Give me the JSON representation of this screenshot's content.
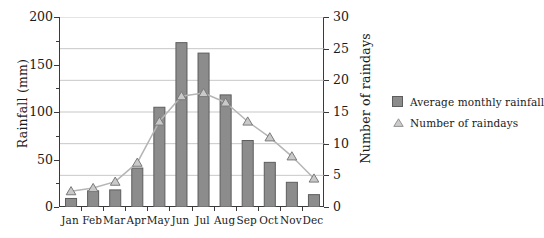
{
  "chart_data": {
    "type": "bar",
    "title": "",
    "categories": [
      "Jan",
      "Feb",
      "Mar",
      "Apr",
      "May",
      "Jun",
      "Jul",
      "Aug",
      "Sep",
      "Oct",
      "Nov",
      "Dec"
    ],
    "series": [
      {
        "name": "Average monthly rainfall",
        "type": "bar",
        "axis": "left",
        "unit": "mm",
        "values": [
          9,
          17,
          18,
          41,
          105,
          173,
          162,
          118,
          70,
          47,
          26,
          13
        ]
      },
      {
        "name": "Number of raindays",
        "type": "line-marker",
        "axis": "right",
        "unit": "days",
        "values": [
          2.5,
          3,
          4,
          7,
          13.5,
          17.5,
          18,
          16.5,
          13.5,
          11,
          8,
          4.5
        ]
      }
    ],
    "xlabel": "",
    "ylabel": "Rainfall (mm)",
    "y2label": "Number of raindays",
    "ylim": [
      0,
      200
    ],
    "y2lim": [
      0,
      30
    ],
    "yticks": [
      0,
      50,
      100,
      150,
      200
    ],
    "y2ticks": [
      0,
      5,
      10,
      15,
      20,
      25,
      30
    ],
    "ytick_labels": [
      "0",
      "50",
      "100",
      "150",
      "200"
    ],
    "y2tick_labels": [
      "0",
      "5",
      "10",
      "15",
      "20",
      "25",
      "30"
    ],
    "grid": true,
    "grid_source": "right-axis",
    "legend_position": "right",
    "legend": [
      {
        "label": "Average monthly rainfall",
        "marker": "square",
        "color": "#8c8c8c"
      },
      {
        "label": "Number of raindays",
        "marker": "triangle",
        "color": "#9a9a9a"
      }
    ],
    "colors": {
      "bar_fill": "#8c8c8c",
      "bar_stroke": "#5d5d5d",
      "line": "#b5b5b5",
      "marker_fill": "#c9c9c9",
      "marker_stroke": "#7a7a7a",
      "axis": "#3a3a3a",
      "grid": "#b9b9b9"
    }
  },
  "faint_title": ""
}
